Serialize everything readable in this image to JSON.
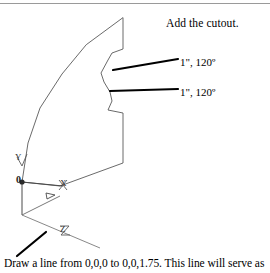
{
  "page": {
    "background_color": "#ffffff",
    "ink_color": "#000000",
    "outline_color": "#555555",
    "rule_color": "#9a9a9a",
    "width": 270,
    "height": 273
  },
  "header": {
    "divider": "horizontal-rule"
  },
  "figure": {
    "title": "Add the cutout.",
    "caption": "Draw a line from 0,0,0 to 0,0,1.75. This line will serve as",
    "annotations": [
      {
        "id": "cutout-upper",
        "label": "1\", 120º"
      },
      {
        "id": "cutout-lower",
        "label": "1\", 120º"
      }
    ],
    "ucs_icon": {
      "origin_label": "0",
      "x_axis_label": "X",
      "y_axis_label": "Y",
      "z_axis_label": "Z"
    },
    "profile_outline": {
      "name": "extruded-profile-polyline",
      "points": "123,18 123,49 112,53 108,60 101,73 104,82 110,92 112,101 108,110 123,113 123,163 60,186 22,182 28,143 40,108 62,74 86,45"
    },
    "leader_lines": [
      {
        "id": "leader-upper",
        "x1": 113,
        "y1": 70,
        "x2": 178,
        "y2": 59,
        "width": 2.2
      },
      {
        "id": "leader-lower",
        "x1": 110,
        "y1": 91,
        "x2": 178,
        "y2": 89,
        "width": 2.2
      },
      {
        "id": "leader-caption",
        "x1": 17,
        "y1": 256,
        "x2": 46,
        "y2": 232,
        "width": 2.2
      }
    ]
  }
}
